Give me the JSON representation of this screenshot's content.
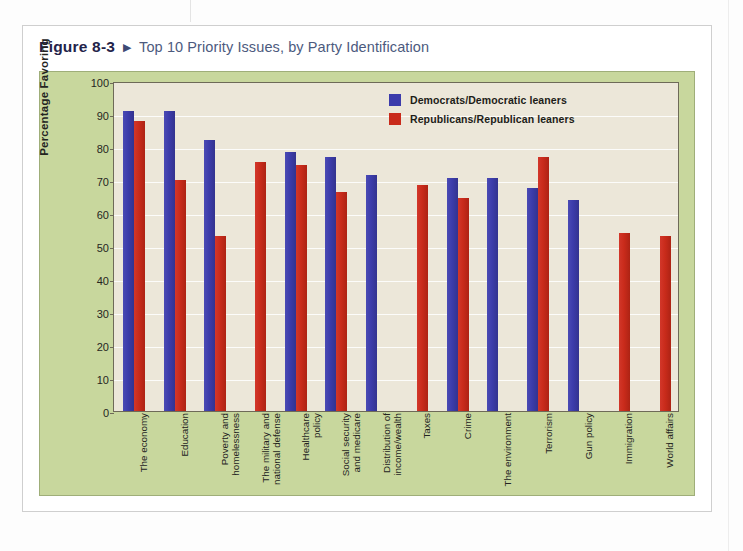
{
  "figure": {
    "number": "Figure 8-3",
    "arrow": "▶",
    "title": "Top 10 Priority Issues, by Party Identification"
  },
  "legend": {
    "position": "top-right",
    "items": [
      {
        "label": "Democrats/Democratic leaners",
        "color": "#3c3cab",
        "swatch": "legend-swatch-democrats"
      },
      {
        "label": "Republicans/Republican leaners",
        "color": "#c92b1b",
        "swatch": "legend-swatch-republicans"
      }
    ]
  },
  "colors": {
    "democrat_blue": "#3c3cab",
    "republican_red": "#c92b1b",
    "panel_green": "#c8d79d",
    "plot_background": "#ece7d9",
    "gridline": "#ffffff",
    "axis_line": "#6e6a58",
    "title_navy": "#23234a",
    "subtitle_slate": "#4c5a7e"
  },
  "chart_data": {
    "type": "bar",
    "title": "Top 10 Priority Issues, by Party Identification",
    "xlabel": "",
    "ylabel": "Percentage Favoring",
    "ylim": [
      0,
      100
    ],
    "yticks": [
      0,
      10,
      20,
      30,
      40,
      50,
      60,
      70,
      80,
      90,
      100
    ],
    "ytick_labels": [
      "0",
      "10",
      "20",
      "30",
      "40",
      "50",
      "60",
      "70",
      "80",
      "90",
      "100"
    ],
    "grid": true,
    "legend_position": "upper right",
    "categories": [
      "The economy",
      "Education",
      "Poverty and homelessness",
      "The military and national defense",
      "Healthcare policy",
      "Social security and medicare",
      "Distribution of income/wealth",
      "Taxes",
      "Crime",
      "The environment",
      "Terrorism",
      "Gun policy",
      "Immigration",
      "World affairs"
    ],
    "series": [
      {
        "name": "Democrats/Democratic leaners",
        "color": "#3c3cab",
        "values": [
          91,
          91,
          82,
          null,
          78.5,
          77,
          71.5,
          null,
          70.5,
          70.5,
          67.5,
          64,
          null,
          null
        ]
      },
      {
        "name": "Republicans/Republican leaners",
        "color": "#c92b1b",
        "values": [
          88,
          70,
          53,
          75.5,
          74.5,
          66.5,
          null,
          68.5,
          64.5,
          null,
          77,
          null,
          54,
          53
        ]
      }
    ]
  }
}
